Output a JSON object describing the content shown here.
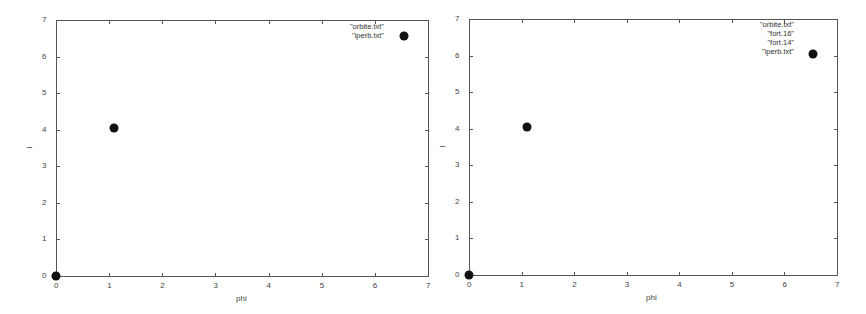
{
  "chart_data": [
    {
      "type": "scatter",
      "title": "",
      "xlabel": "phi",
      "ylabel": "I",
      "xlim": [
        0,
        7
      ],
      "ylim": [
        0,
        7
      ],
      "xticks": [
        "0",
        "1",
        "2",
        "3",
        "4",
        "5",
        "6",
        "7"
      ],
      "yticks": [
        "0",
        "1",
        "2",
        "3",
        "4",
        "5",
        "6",
        "7"
      ],
      "grid": false,
      "legend_position": "top-right",
      "legend": [
        "\"orbite.txt\"",
        "\"iperb.txt\""
      ],
      "points": [
        {
          "x": 0,
          "y": 0
        },
        {
          "x": 1.1,
          "y": 4.05
        },
        {
          "x": 6.55,
          "y": 6.55
        }
      ]
    },
    {
      "type": "scatter",
      "title": "",
      "xlabel": "phi",
      "ylabel": "I",
      "xlim": [
        0,
        7
      ],
      "ylim": [
        0,
        7
      ],
      "xticks": [
        "0",
        "1",
        "2",
        "3",
        "4",
        "5",
        "6",
        "7"
      ],
      "yticks": [
        "0",
        "1",
        "2",
        "3",
        "4",
        "5",
        "6",
        "7"
      ],
      "grid": false,
      "legend_position": "top-right",
      "legend": [
        "\"orbite.txt\"",
        "\"fort.16\"",
        "\"fort.14\"",
        "\"iperb.txt\""
      ],
      "points": [
        {
          "x": 0,
          "y": 0
        },
        {
          "x": 1.1,
          "y": 4.05
        },
        {
          "x": 6.55,
          "y": 6.05
        }
      ]
    }
  ]
}
